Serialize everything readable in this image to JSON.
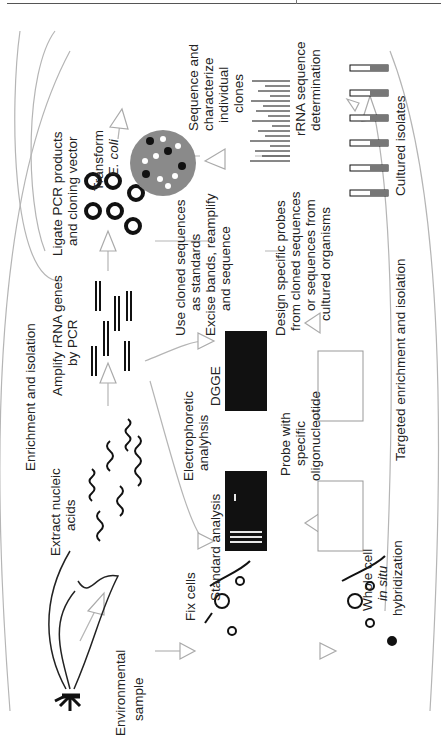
{
  "figure": {
    "orientation": "rotated 90 degrees counter-clockwise",
    "labels": {
      "environmental_sample": [
        "Environmental",
        "sample"
      ],
      "extract_nucleic_acids": [
        "Extract nucleic",
        "acids"
      ],
      "enrichment_isolation": "Enrichment and isolation",
      "amplify": [
        "Amplify rRNA genes",
        "by PCR"
      ],
      "ligate": [
        "Ligate PCR products",
        "and cloning vector"
      ],
      "transform": [
        "Transform",
        "E. coli"
      ],
      "sequence_clones": [
        "Sequence and",
        "characterize",
        "individual",
        "clones"
      ],
      "rrna_determination": [
        "rRNA sequence",
        "determination"
      ],
      "cultured_isolates": "Cultured isolates",
      "use_cloned": [
        "Use cloned sequences",
        "as standards"
      ],
      "excise_bands": [
        "Excise bands, reamplify",
        "and sequence"
      ],
      "electrophoretic": [
        "Electrophoretic",
        "analyhsis"
      ],
      "dgge": "DGGE",
      "standard_analysis": "Standard analysis",
      "probe": [
        "Probe with",
        "specific",
        "oligonucleotide"
      ],
      "design_probes": [
        "Design specific probes",
        "from cloned sequences",
        "or sequences from",
        "cultured organisms"
      ],
      "fix_cells": "Fix cells",
      "whole_cell": [
        "Whole cell",
        "in situ",
        "hybridization"
      ],
      "targeted_enrichment": "Targeted enrichment and isolation"
    },
    "colors": {
      "gel": "#111111",
      "gel_band": "#e8e8e8",
      "plate": "#8a8a8a",
      "arrow": "#b5b5b5",
      "ink": "#222222"
    }
  }
}
